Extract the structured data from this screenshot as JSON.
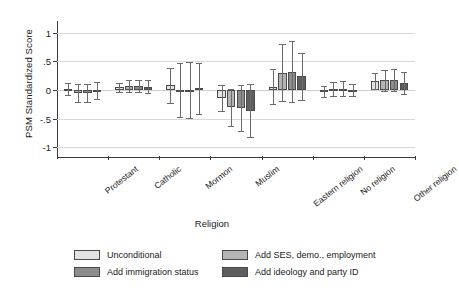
{
  "chart_data": {
    "type": "bar",
    "title": "",
    "xlabel": "Religion",
    "ylabel": "PSM Standardized Score",
    "categories": [
      "Protestant",
      "Catholic",
      "Mormon",
      "Muslim",
      "Eastern religion",
      "No religion",
      "Other religion"
    ],
    "ylim": [
      -1.15,
      1.15
    ],
    "yticks": [
      1,
      0.5,
      0,
      -0.5,
      -1
    ],
    "ytick_labels": [
      "1",
      ".5",
      "0",
      "-.5",
      "-1"
    ],
    "grid": "horizontal",
    "legend_position": "bottom",
    "error_bars": "95% confidence interval",
    "series": [
      {
        "name": "Unconditional",
        "color": "#e2e2e2",
        "values": [
          0.02,
          0.05,
          0.08,
          -0.14,
          0.06,
          -0.03,
          0.15
        ],
        "ci_low": [
          -0.09,
          -0.03,
          -0.22,
          -0.37,
          -0.25,
          -0.13,
          0.01
        ],
        "ci_high": [
          0.13,
          0.13,
          0.38,
          0.09,
          0.37,
          0.07,
          0.29
        ]
      },
      {
        "name": "Add SES, demo., employment",
        "color": "#b4b4b4",
        "values": [
          -0.05,
          0.07,
          0.0,
          -0.3,
          0.3,
          0.02,
          0.17
        ],
        "ci_low": [
          -0.21,
          -0.04,
          -0.47,
          -0.62,
          -0.2,
          -0.1,
          -0.01
        ],
        "ci_high": [
          0.11,
          0.18,
          0.47,
          0.02,
          0.8,
          0.14,
          0.35
        ]
      },
      {
        "name": "Add immigration status",
        "color": "#8c8c8c",
        "values": [
          -0.05,
          0.07,
          0.0,
          -0.32,
          0.32,
          0.02,
          0.17
        ],
        "ci_low": [
          -0.21,
          -0.04,
          -0.48,
          -0.72,
          -0.21,
          -0.11,
          -0.02
        ],
        "ci_high": [
          0.11,
          0.18,
          0.48,
          0.08,
          0.85,
          0.15,
          0.36
        ]
      },
      {
        "name": "Add ideology and party ID",
        "color": "#5e5e5e",
        "values": [
          -0.01,
          0.06,
          0.03,
          -0.36,
          0.24,
          0.0,
          0.12
        ],
        "ci_low": [
          -0.16,
          -0.05,
          -0.41,
          -0.82,
          -0.17,
          -0.11,
          -0.07
        ],
        "ci_high": [
          0.14,
          0.17,
          0.47,
          0.1,
          0.65,
          0.11,
          0.31
        ]
      }
    ]
  },
  "axes": {
    "ylabel": "PSM Standardized Score",
    "xlabel": "Religion"
  },
  "legend": {
    "items": [
      {
        "label": "Unconditional"
      },
      {
        "label": "Add SES, demo., employment"
      },
      {
        "label": "Add immigration status"
      },
      {
        "label": "Add ideology and party ID"
      }
    ]
  }
}
